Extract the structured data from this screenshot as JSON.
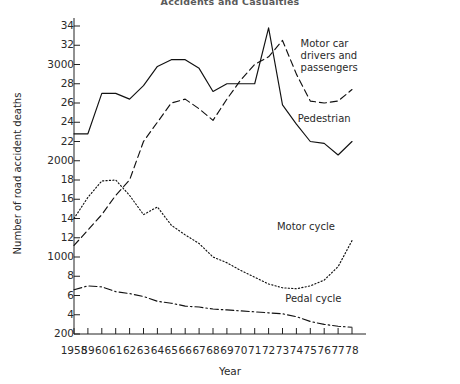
{
  "chart_data": {
    "type": "line",
    "title": "Accidents and Casualties",
    "xlabel": "Year",
    "ylabel": "Number of road accident deaths",
    "grid": false,
    "legend_position": "inline-right-annotations",
    "x": [
      1958,
      1959,
      1960,
      1961,
      1962,
      1963,
      1964,
      1965,
      1966,
      1967,
      1968,
      1969,
      1970,
      1971,
      1972,
      1973,
      1974,
      1975,
      1976,
      1977,
      1978
    ],
    "xtick_labels": [
      "1958",
      "59",
      "60",
      "61",
      "62",
      "63",
      "64",
      "65",
      "66",
      "67",
      "68",
      "69",
      "70",
      "71",
      "72",
      "73",
      "74",
      "75",
      "76",
      "77",
      "78"
    ],
    "ylim": [
      200,
      3400
    ],
    "ytick_values": [
      200,
      400,
      600,
      800,
      1000,
      1200,
      1400,
      1600,
      1800,
      2000,
      2200,
      2400,
      2600,
      2800,
      3000,
      3200,
      3400
    ],
    "ytick_labels": [
      "200",
      "4",
      "6",
      "8",
      "1000",
      "12",
      "14",
      "16",
      "18",
      "2000",
      "22",
      "24",
      "26",
      "28",
      "3000",
      "32",
      "34"
    ],
    "series": [
      {
        "name": "Pedestrian",
        "style": "solid",
        "label_x": 1974.1,
        "label_y": 2430,
        "values": [
          2280,
          2280,
          2700,
          2700,
          2640,
          2780,
          2980,
          3050,
          3050,
          2960,
          2720,
          2800,
          2800,
          2800,
          3380,
          2580,
          2380,
          2200,
          2180,
          2060,
          2200
        ]
      },
      {
        "name": "Motor car drivers and passengers",
        "style": "dashed",
        "label_x": 1974.3,
        "label_y": 3210,
        "values": [
          1120,
          1280,
          1440,
          1640,
          1800,
          2200,
          2400,
          2600,
          2640,
          2540,
          2420,
          2640,
          2840,
          3000,
          3080,
          3250,
          2900,
          2620,
          2600,
          2620,
          2740
        ]
      },
      {
        "name": "Motor cycle",
        "style": "dotted",
        "label_x": 1972.6,
        "label_y": 1310,
        "values": [
          1400,
          1620,
          1790,
          1800,
          1640,
          1440,
          1520,
          1330,
          1230,
          1140,
          1000,
          940,
          860,
          790,
          720,
          680,
          670,
          700,
          760,
          900,
          1170
        ]
      },
      {
        "name": "Pedal cycle",
        "style": "dashdot",
        "label_x": 1973.2,
        "label_y": 560,
        "values": [
          660,
          700,
          690,
          640,
          620,
          590,
          540,
          520,
          490,
          480,
          460,
          450,
          440,
          430,
          420,
          410,
          380,
          330,
          300,
          280,
          270
        ]
      }
    ]
  }
}
